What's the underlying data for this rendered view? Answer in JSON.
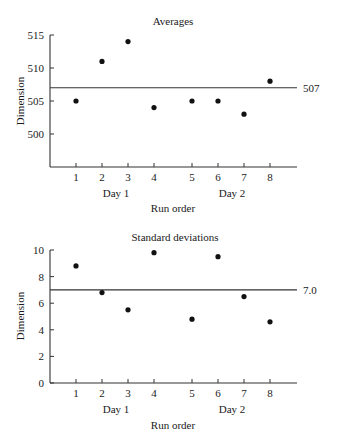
{
  "chart_data": [
    {
      "type": "scatter",
      "title": "Averages",
      "xlabel": "Run order",
      "ylabel": "Dimension",
      "x": [
        1,
        2,
        3,
        4,
        5,
        6,
        7,
        8
      ],
      "values": [
        505,
        511,
        514,
        504,
        505,
        505,
        503,
        508
      ],
      "yticks": [
        500,
        505,
        510,
        515
      ],
      "ylim": [
        495,
        515
      ],
      "reference_line": {
        "value": 507,
        "label": "507"
      },
      "groups": [
        {
          "label": "Day 1",
          "runs": [
            1,
            2,
            3,
            4
          ]
        },
        {
          "label": "Day 2",
          "runs": [
            5,
            6,
            7,
            8
          ]
        }
      ],
      "grid": false,
      "legend": null
    },
    {
      "type": "scatter",
      "title": "Standard deviations",
      "xlabel": "Run order",
      "ylabel": "Dimension",
      "x": [
        1,
        2,
        3,
        4,
        5,
        6,
        7,
        8
      ],
      "values": [
        8.8,
        6.8,
        5.5,
        9.8,
        4.8,
        9.5,
        6.5,
        4.6
      ],
      "yticks": [
        0,
        2,
        4,
        6,
        8,
        10
      ],
      "ylim": [
        0,
        10
      ],
      "reference_line": {
        "value": 7.0,
        "label": "7.0"
      },
      "groups": [
        {
          "label": "Day 1",
          "runs": [
            1,
            2,
            3,
            4
          ]
        },
        {
          "label": "Day 2",
          "runs": [
            5,
            6,
            7,
            8
          ]
        }
      ],
      "grid": false,
      "legend": null
    }
  ],
  "layout": {
    "x_tick_px": [
      76,
      102,
      128,
      154,
      192,
      218,
      244,
      270
    ],
    "axis_x0": 50,
    "axis_x1": 297,
    "charts": [
      {
        "top": 35,
        "bottom": 167,
        "ymin": 495,
        "ymax": 515,
        "title_y": 25,
        "tick_label_y": 181,
        "day_y": 197,
        "xlabel_y": 212,
        "ylabel_y": 101,
        "title_x": 173
      },
      {
        "top": 250,
        "bottom": 383,
        "ymin": 0,
        "ymax": 10,
        "title_y": 241,
        "tick_label_y": 397,
        "day_y": 413,
        "xlabel_y": 429,
        "ylabel_y": 316,
        "title_x": 175
      }
    ],
    "day_label_x": [
      116,
      232
    ]
  }
}
